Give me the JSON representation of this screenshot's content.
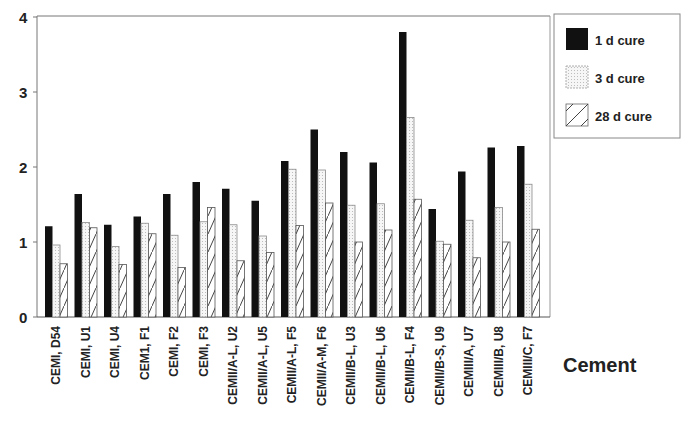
{
  "chart_data": {
    "type": "bar",
    "title": "",
    "xlabel": "Cement",
    "ylabel": "",
    "ylim": [
      0,
      4
    ],
    "yticks": [
      0,
      1,
      2,
      3,
      4
    ],
    "grid": false,
    "legend_position": "right-top",
    "categories": [
      "CEMI, D54",
      "CEMI, U1",
      "CEMI, U4",
      "CEM1, F1",
      "CEMI, F2",
      "CEMI, F3",
      "CEMII/A-L, U2",
      "CEMII/A-L, U5",
      "CEMII/A-L, F5",
      "CEMII/A-M, F6",
      "CEMII/B-L, U3",
      "CEMII/B-L, U6",
      "CEMII/B-L, F4",
      "CEMII/B-S, U9",
      "CEMIII/A, U7",
      "CEMIII/B, U8",
      "CEMIII/C, F7"
    ],
    "series": [
      {
        "name": "1 d cure",
        "pattern": "solid",
        "color": "#111111",
        "values": [
          1.21,
          1.64,
          1.23,
          1.34,
          1.64,
          1.8,
          1.71,
          1.55,
          2.08,
          2.5,
          2.2,
          2.06,
          3.8,
          1.44,
          1.94,
          2.26,
          2.28
        ]
      },
      {
        "name": "3 d cure",
        "pattern": "dotted",
        "color": "#f2f2f2",
        "values": [
          0.96,
          1.26,
          0.94,
          1.25,
          1.09,
          1.27,
          1.23,
          1.08,
          1.97,
          1.96,
          1.49,
          1.51,
          2.66,
          1.01,
          1.29,
          1.46,
          1.77
        ]
      },
      {
        "name": "28 d cure",
        "pattern": "hatched",
        "color": "#ffffff",
        "values": [
          0.71,
          1.19,
          0.7,
          1.11,
          0.66,
          1.46,
          0.75,
          0.86,
          1.22,
          1.52,
          1.0,
          1.16,
          1.57,
          0.97,
          0.79,
          1.0,
          1.17
        ]
      }
    ]
  },
  "legend": {
    "items": [
      {
        "label": "1 d cure"
      },
      {
        "label": "3 d cure"
      },
      {
        "label": "28 d cure"
      }
    ]
  },
  "axis": {
    "x_title": "Cement",
    "y_tick_labels": [
      "0",
      "1",
      "2",
      "3",
      "4"
    ]
  }
}
